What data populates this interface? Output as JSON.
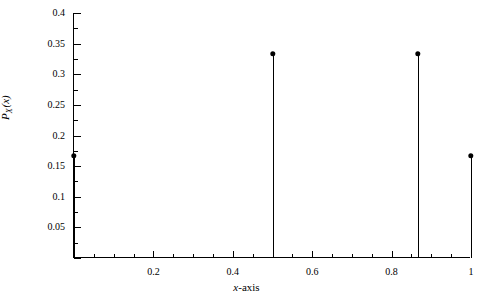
{
  "chart_data": {
    "type": "scatter",
    "plot_style": "stem",
    "title": "",
    "xlabel": "x-axis",
    "ylabel": "P_X (x)",
    "ylabel_parts": {
      "main": "P",
      "subscript": "X",
      "argument": "(x)"
    },
    "x": [
      0,
      0.5,
      0.866,
      1
    ],
    "values": [
      0.1667,
      0.3333,
      0.3333,
      0.1667
    ],
    "xlim": [
      0,
      1
    ],
    "ylim": [
      0,
      0.4
    ],
    "grid": false,
    "legend": null,
    "marker": "filled-circle",
    "line_color": "#000000",
    "xticks": [
      0,
      0.2,
      0.4,
      0.6,
      0.8,
      1
    ],
    "xtick_labels": [
      "",
      "0.2",
      "0.4",
      "0.6",
      "0.8",
      "1"
    ],
    "xtick_minor_count_between": 3,
    "yticks": [
      0,
      0.05,
      0.1,
      0.15,
      0.2,
      0.25,
      0.3,
      0.35,
      0.4
    ],
    "ytick_labels": [
      "",
      "0.05",
      "0.1",
      "0.15",
      "0.2",
      "0.25",
      "0.3",
      "0.35",
      "0.4"
    ],
    "ytick_minor_count_between": 1,
    "points": [
      {
        "x": 0,
        "y": 0.1667
      },
      {
        "x": 0.5,
        "y": 0.3333
      },
      {
        "x": 0.866,
        "y": 0.3333
      },
      {
        "x": 1,
        "y": 0.1667
      }
    ]
  },
  "axes": {
    "x_label_text": "x-axis",
    "x_label_italic": "x",
    "x_label_rest": "-axis",
    "y_label_main": "P",
    "y_label_sub": "X",
    "y_label_arg": "(x)"
  },
  "colors": {
    "background": "#ffffff",
    "foreground": "#000000"
  }
}
